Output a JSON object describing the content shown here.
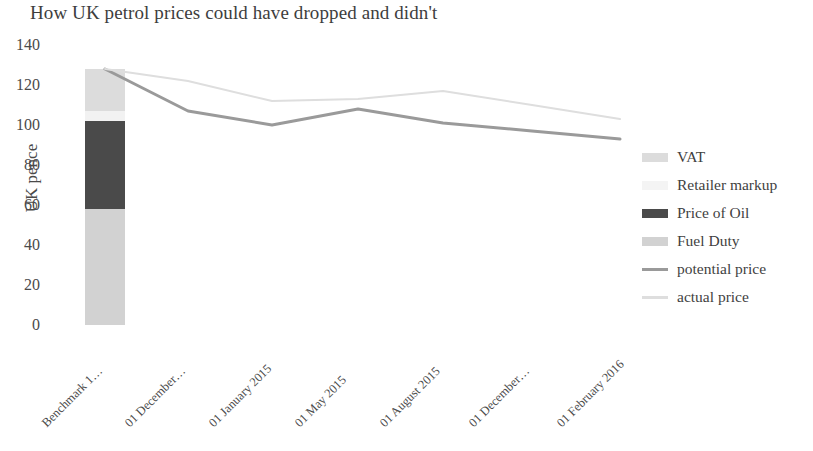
{
  "chart_data": {
    "type": "bar",
    "title": "How UK petrol prices could have dropped and didn't",
    "xlabel": "",
    "ylabel": "UK pence",
    "ylim": [
      0,
      140
    ],
    "ytick_step": 20,
    "yticks": [
      "140",
      "120",
      "100",
      "80",
      "60",
      "40",
      "20",
      "0"
    ],
    "grid": false,
    "legend_position": "right",
    "stacked": true,
    "categories": [
      "Benchmark 1…",
      "01 December…",
      "01 January 2015",
      "01 May 2015",
      "01 August 2015",
      "01 December…",
      "01 February 2016"
    ],
    "bar_categories": [
      "Benchmark 1…"
    ],
    "stack_series": [
      {
        "name": "Fuel Duty",
        "color": "#d2d2d2",
        "values": [
          58
        ]
      },
      {
        "name": "Price of Oil",
        "color": "#4a4a4a",
        "values": [
          44
        ]
      },
      {
        "name": "Retailer markup",
        "color": "#f2f2f2",
        "values": [
          5
        ]
      },
      {
        "name": "VAT",
        "color": "#dcdcdc",
        "values": [
          21
        ]
      }
    ],
    "series": [
      {
        "name": "potential price",
        "color": "#9a9a9a",
        "values": [
          128,
          107,
          100,
          108,
          101,
          97,
          93
        ]
      },
      {
        "name": "actual price",
        "color": "#dedede",
        "values": [
          128,
          122,
          112,
          113,
          117,
          110,
          103
        ]
      }
    ],
    "legend_entries": [
      {
        "label": "VAT",
        "type": "swatch",
        "color": "#dcdcdc"
      },
      {
        "label": "Retailer markup",
        "type": "swatch",
        "color": "#f4f4f4"
      },
      {
        "label": "Price of Oil",
        "type": "swatch",
        "color": "#4a4a4a"
      },
      {
        "label": "Fuel Duty",
        "type": "swatch",
        "color": "#d2d2d2"
      },
      {
        "label": "potential price",
        "type": "line",
        "color": "#9a9a9a"
      },
      {
        "label": "actual price",
        "type": "line",
        "color": "#dedede"
      }
    ]
  }
}
